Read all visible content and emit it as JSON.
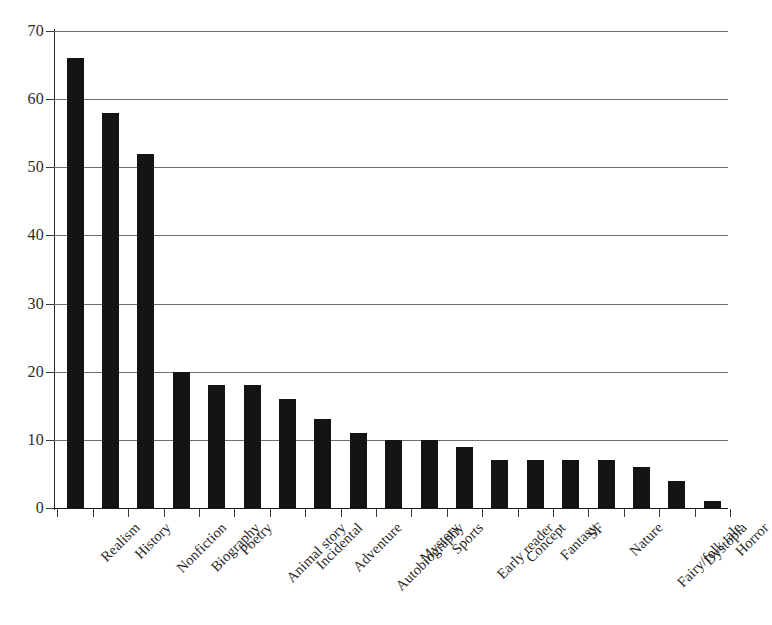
{
  "chart_data": {
    "type": "bar",
    "title": "",
    "subtitle": "",
    "xlabel": "",
    "ylabel": "",
    "ylim": [
      0,
      70
    ],
    "ytick_step": 10,
    "yticks": [
      0,
      10,
      20,
      30,
      40,
      50,
      60,
      70
    ],
    "ytick_labels": [
      "0",
      "10",
      "20",
      "30",
      "40",
      "50",
      "60",
      "70"
    ],
    "grid": true,
    "grid_axis": "y",
    "legend": false,
    "legend_position": "none",
    "orientation": "vertical",
    "sorted": "descending",
    "bar_color": "#141414",
    "gridline_color": "#6f6f6f",
    "axis_color": "#2a2a2a",
    "background_color": "#ffffff",
    "xtick_label_rotation": -45,
    "categories": [
      "Realism",
      "History",
      "Nonfiction",
      "Biography",
      "Poetry",
      "Animal story",
      "Incidental",
      "Adventure",
      "Autobiography",
      "Mystery",
      "Sports",
      "Early reader",
      "Concept",
      "Fantasy",
      "SF",
      "Nature",
      "Fairy/folk tale",
      "Dystopia",
      "Horror"
    ],
    "values": [
      66,
      58,
      52,
      20,
      18,
      18,
      16,
      13,
      11,
      10,
      10,
      9,
      7,
      7,
      7,
      7,
      6,
      4,
      1
    ]
  }
}
